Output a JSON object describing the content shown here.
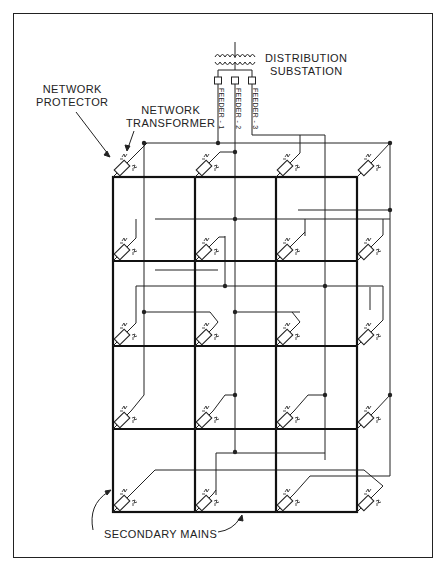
{
  "diagram": {
    "labels": {
      "substation_line1": "DISTRIBUTION",
      "substation_line2": "SUBSTATION",
      "protector_line1": "NETWORK",
      "protector_line2": "PROTECTOR",
      "transformer_line1": "NETWORK",
      "transformer_line2": "TRANSFORMER",
      "secondary_mains": "SECONDARY MAINS"
    },
    "feeders": [
      {
        "label": "FEEDER - 1"
      },
      {
        "label": "FEEDER - 2"
      },
      {
        "label": "FEEDER - 3"
      }
    ],
    "grid": {
      "columns_x": [
        113,
        195,
        276,
        357
      ],
      "rows_y": [
        177,
        261,
        346,
        429,
        512
      ]
    },
    "colors": {
      "line": "#222222",
      "background": "#ffffff"
    }
  }
}
